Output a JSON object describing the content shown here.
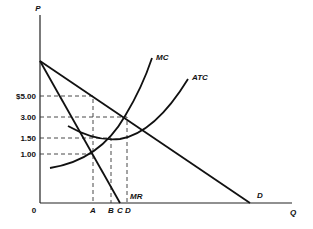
{
  "diagram": {
    "type": "monopoly price-quantity diagram",
    "axes": {
      "y_label": "P",
      "x_label": "Q",
      "origin_label": "0"
    },
    "price_ticks": [
      {
        "label": "$5.00",
        "value": 5.0
      },
      {
        "label": "3.00",
        "value": 3.0
      },
      {
        "label": "1.50",
        "value": 1.5
      },
      {
        "label": "1.00",
        "value": 1.0
      }
    ],
    "quantity_ticks": [
      {
        "label": "A"
      },
      {
        "label": "B"
      },
      {
        "label": "C"
      },
      {
        "label": "D"
      }
    ],
    "curves": [
      {
        "label": "MC",
        "name": "Marginal Cost"
      },
      {
        "label": "ATC",
        "name": "Average Total Cost"
      },
      {
        "label": "MR",
        "name": "Marginal Revenue"
      },
      {
        "label": "D",
        "name": "Demand"
      }
    ]
  }
}
